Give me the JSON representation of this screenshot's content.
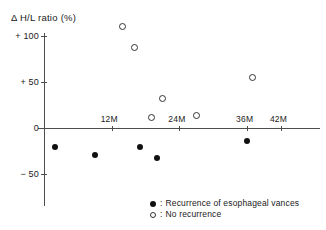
{
  "chart_data": {
    "type": "scatter",
    "title": "",
    "ylabel": "Δ H/L ratio (%)",
    "xlabel": "",
    "xlim": [
      0,
      45
    ],
    "ylim": [
      -75,
      115
    ],
    "grid": false,
    "y_ticks": [
      {
        "value": 100,
        "label": "+ 100"
      },
      {
        "value": 50,
        "label": "+  50"
      },
      {
        "value": 0,
        "label": "0"
      },
      {
        "value": -50,
        "label": "− 50"
      }
    ],
    "x_ticks": [
      {
        "value": 12,
        "label": "12M"
      },
      {
        "value": 24,
        "label": "24M"
      },
      {
        "value": 36,
        "label": "36M"
      },
      {
        "value": 42,
        "label": "42M"
      }
    ],
    "legend_position": "bottom-right",
    "series": [
      {
        "name": "Recurrence of esophageal vances",
        "marker": "filled-circle",
        "color": "#111111",
        "points": [
          {
            "x": 2,
            "y": -21
          },
          {
            "x": 9,
            "y": -29
          },
          {
            "x": 17,
            "y": -20
          },
          {
            "x": 20,
            "y": -32
          },
          {
            "x": 36,
            "y": -14
          }
        ]
      },
      {
        "name": "No recurrence",
        "marker": "open-circle",
        "color": "#333333",
        "points": [
          {
            "x": 14,
            "y": 110
          },
          {
            "x": 16,
            "y": 87
          },
          {
            "x": 19,
            "y": 11
          },
          {
            "x": 21,
            "y": 32
          },
          {
            "x": 27,
            "y": 13
          },
          {
            "x": 37,
            "y": 55
          }
        ]
      }
    ]
  },
  "legend": {
    "entries": [
      {
        "separator": ":",
        "label": "Recurrence of esophageal vances"
      },
      {
        "separator": ":",
        "label": "No recurrence"
      }
    ]
  },
  "colors": {
    "axis": "#4d4d4d",
    "text": "#1a1a1a",
    "filled_marker": "#111111",
    "open_marker": "#333333",
    "background": "#ffffff"
  }
}
